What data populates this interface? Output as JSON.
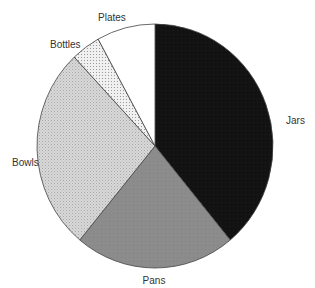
{
  "chart_data": {
    "type": "pie",
    "title": "",
    "start_angle_deg": 0,
    "direction": "clockwise",
    "categories": [
      "Jars",
      "Pans",
      "Bowls",
      "Bottles",
      "Plates"
    ],
    "values": [
      39,
      22,
      27,
      4,
      8
    ],
    "unit": "percent (estimated from slice angles)",
    "legend": "none (labels placed outside slices)",
    "slices": [
      {
        "label": "Jars",
        "value": 39,
        "color": "#121212",
        "pattern": "solid-dark"
      },
      {
        "label": "Pans",
        "value": 22,
        "color": "#8c8c8c",
        "pattern": "solid-medium"
      },
      {
        "label": "Bowls",
        "value": 27,
        "color": "#cfcfcf",
        "pattern": "fine-dots"
      },
      {
        "label": "Bottles",
        "value": 4,
        "color": "#e6e6e6",
        "pattern": "sparse-dots"
      },
      {
        "label": "Plates",
        "value": 8,
        "color": "#ffffff",
        "pattern": "none"
      }
    ]
  },
  "layout": {
    "cx": 155,
    "cy": 146,
    "rx": 118,
    "ry": 122,
    "labels": [
      {
        "text": "Jars",
        "x": 286,
        "y": 124,
        "anchor": "start"
      },
      {
        "text": "Pans",
        "x": 154,
        "y": 284,
        "anchor": "middle"
      },
      {
        "text": "Bowls",
        "x": 12,
        "y": 166,
        "anchor": "start"
      },
      {
        "text": "Bottles",
        "x": 50,
        "y": 48,
        "anchor": "start"
      },
      {
        "text": "Plates",
        "x": 98,
        "y": 21,
        "anchor": "start"
      }
    ]
  }
}
